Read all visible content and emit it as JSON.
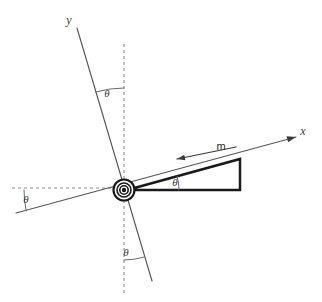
{
  "figure": {
    "kind": "physics-free-body-diagram",
    "width": 322,
    "height": 302,
    "background_color": "#ffffff"
  },
  "colors": {
    "axis_solid": "#55565a",
    "guide_dashed": "#8d8e92",
    "wedge_stroke": "#1a1a1a",
    "wedge_fill": "#ffffff",
    "arrow": "#3a3a3c",
    "pivot": "#1a1a1a",
    "text": "#3a3a3c"
  },
  "labels": {
    "y_axis": "y",
    "x_axis": "x",
    "mass": "m",
    "theta": "θ"
  },
  "angles": [
    {
      "id": "theta-y-axis",
      "label": "θ",
      "x": 107,
      "y": 97,
      "location": "between tilted y-axis and vertical dashed reference"
    },
    {
      "id": "theta-left",
      "label": "θ",
      "x": 26,
      "y": 203,
      "location": "between horizontal dashed reference and tilted x-axis, left side"
    },
    {
      "id": "theta-incline",
      "label": "θ",
      "x": 175,
      "y": 186,
      "location": "incline angle inside the wedge at its apex"
    },
    {
      "id": "theta-bottom",
      "label": "θ",
      "x": 126,
      "y": 256,
      "location": "between vertical dashed reference and tilted y-axis, below pivot"
    }
  ],
  "geometry": {
    "pivot": {
      "x": 124,
      "y": 190,
      "outer_r": 10.5,
      "mid_r": 7.0,
      "inner_r": 4.2,
      "core_r": 2.2
    },
    "x_axis": {
      "x1": 16,
      "y1": 213,
      "x2": 296,
      "y2": 137,
      "arrow_at": "x2"
    },
    "y_axis": {
      "x1": 77,
      "y1": 28,
      "x2": 152,
      "y2": 281,
      "arrow_at": "none"
    },
    "vertical_guide": {
      "x1": 124,
      "y1": 44,
      "x2": 124,
      "y2": 296
    },
    "horizontal_guide": {
      "x1": 12,
      "y1": 188,
      "x2": 124,
      "y2": 188
    },
    "wedge": {
      "apex": {
        "x": 127,
        "y": 190
      },
      "bottom_right": {
        "x": 240,
        "y": 190
      },
      "top_right": {
        "x": 240,
        "y": 159
      }
    },
    "mass_arrow": {
      "x1": 236,
      "y1": 147,
      "x2": 177,
      "y2": 159
    },
    "y_label": {
      "x": 69,
      "y": 24
    },
    "x_label": {
      "x": 303,
      "y": 135
    },
    "m_label": {
      "x": 221,
      "y": 150
    }
  }
}
